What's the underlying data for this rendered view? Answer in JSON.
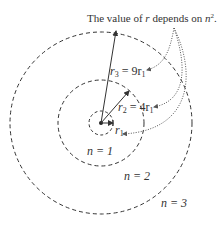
{
  "caption": {
    "text_pre": "The value of ",
    "var_r": "r",
    "text_mid": " depends on ",
    "var_n": "n",
    "exp": "2",
    "text_post": "."
  },
  "orbits": [
    {
      "n_label": "n = 1",
      "radius_label": "r",
      "radius_sub": "1",
      "radius_expr": ""
    },
    {
      "n_label": "n = 2",
      "radius_label": "r",
      "radius_sub": "2",
      "radius_expr": " = 4r",
      "expr_sub": "1"
    },
    {
      "n_label": "n = 3",
      "radius_label": "r",
      "radius_sub": "3",
      "radius_expr": " = 9r",
      "expr_sub": "1"
    }
  ],
  "colors": {
    "line": "#333333",
    "dotted": "#555555"
  }
}
